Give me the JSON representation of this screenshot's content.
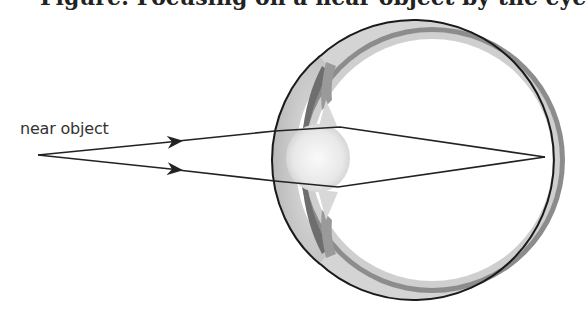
{
  "figure": {
    "title_cropped": "Figure: Focusing on a near object by the eye",
    "label": "near object"
  },
  "colors": {
    "outline": "#1a1a1a",
    "sclera_light": "#d6d6d6",
    "sclera_dark": "#8a8a8a",
    "iris": "#7a7a7a",
    "lens": "#eeeeee",
    "ray": "#222222"
  },
  "geometry": {
    "object_point": [
      38,
      155
    ],
    "focus_point": [
      545,
      157
    ],
    "eye_center": [
      432,
      160
    ],
    "eye_radius": 140
  }
}
